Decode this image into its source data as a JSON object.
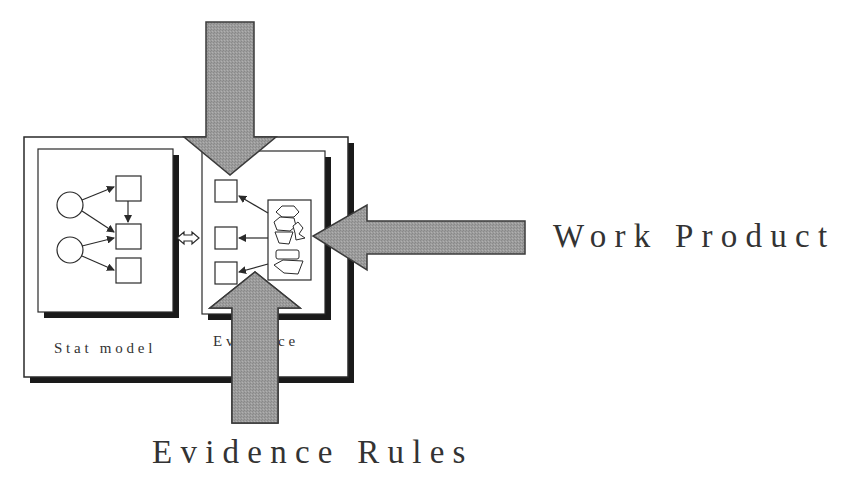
{
  "diagram": {
    "labels": {
      "stat_model": "Stat model",
      "evidence": "Evidence",
      "work_product": "Work Product",
      "evidence_rules": "Evidence Rules"
    },
    "colors": {
      "arrow_fill": "#9a9a9a",
      "arrow_stroke": "#3a3a3a",
      "box_stroke": "#2a2a2a",
      "shadow": "#1a1a1a",
      "background": "#ffffff"
    },
    "nodes": {
      "stat_model": {
        "circles": 2,
        "squares": 3
      },
      "evidence": {
        "squares": 3,
        "work_product_shapes": 5
      }
    },
    "connectors": {
      "stat_to_evidence": "double-headed arrow"
    },
    "arrows": [
      {
        "id": "top-arrow",
        "direction": "down"
      },
      {
        "id": "work-product-arrow",
        "direction": "left",
        "label": "Work Product"
      },
      {
        "id": "evidence-rules-arrow",
        "direction": "up",
        "label": "Evidence Rules"
      }
    ]
  }
}
